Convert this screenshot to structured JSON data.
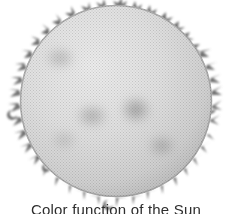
{
  "figure": {
    "caption": "Color function of the Sun",
    "caption_clipped": true,
    "background_color": "#ffffff",
    "disk": {
      "center_x": 116,
      "center_y": 101,
      "radius": 96,
      "fill_center_color": "#e3e3e3",
      "fill_edge_color": "#b9b9b9",
      "rim_color": "#8a8a8a",
      "texture": "halftone-dots"
    },
    "corona": {
      "name": "solar-prominences",
      "color": "#6f6f6f",
      "count": 46,
      "description": "curled flame-like prominences around the limb"
    },
    "sunspots": [
      {
        "name": "sunspot-upper-left",
        "cx": 60,
        "cy": 58,
        "rx": 16,
        "ry": 11,
        "opacity": 0.22
      },
      {
        "name": "sunspot-center-left",
        "cx": 92,
        "cy": 116,
        "rx": 17,
        "ry": 12,
        "opacity": 0.26
      },
      {
        "name": "sunspot-center",
        "cx": 136,
        "cy": 110,
        "rx": 16,
        "ry": 14,
        "opacity": 0.34
      },
      {
        "name": "sunspot-lower-right",
        "cx": 162,
        "cy": 146,
        "rx": 15,
        "ry": 11,
        "opacity": 0.28
      },
      {
        "name": "sunspot-lower-left",
        "cx": 64,
        "cy": 140,
        "rx": 14,
        "ry": 10,
        "opacity": 0.16
      }
    ]
  }
}
